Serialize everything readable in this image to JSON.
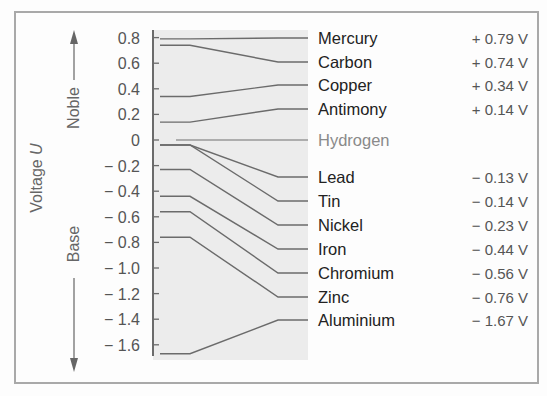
{
  "chart_data": {
    "type": "table",
    "title": "",
    "ylabel": "Voltage U",
    "ylim": [
      -1.7,
      0.85
    ],
    "yticks": [
      "0.8",
      "0.6",
      "0.4",
      "0.2",
      "0",
      "− 0.2",
      "− 0.4",
      "− 0.6",
      "− 0.8",
      "− 1.0",
      "− 1.2",
      "− 1.4",
      "− 1.6"
    ],
    "ytick_values": [
      0.8,
      0.6,
      0.4,
      0.2,
      0,
      -0.2,
      -0.4,
      -0.6,
      -0.8,
      -1.0,
      -1.2,
      -1.4,
      -1.6
    ],
    "annotations": {
      "up": "Noble",
      "down": "Base"
    },
    "series": [
      {
        "name": "Mercury",
        "value": 0.79,
        "label": "+ 0.79 V"
      },
      {
        "name": "Carbon",
        "value": 0.74,
        "label": "+ 0.74 V"
      },
      {
        "name": "Copper",
        "value": 0.34,
        "label": "+ 0.34 V"
      },
      {
        "name": "Antimony",
        "value": 0.14,
        "label": "+ 0.14 V"
      },
      {
        "name": "Hydrogen",
        "value": 0,
        "label": ""
      },
      {
        "name": "Lead",
        "value": -0.13,
        "label": "− 0.13 V"
      },
      {
        "name": "Tin",
        "value": -0.14,
        "label": "− 0.14 V"
      },
      {
        "name": "Nickel",
        "value": -0.23,
        "label": "− 0.23 V"
      },
      {
        "name": "Iron",
        "value": -0.44,
        "label": "− 0.44 V"
      },
      {
        "name": "Chromium",
        "value": -0.56,
        "label": "− 0.56 V"
      },
      {
        "name": "Zinc",
        "value": -0.76,
        "label": "− 0.76 V"
      },
      {
        "name": "Aluminium",
        "value": -1.67,
        "label": "− 1.67 V"
      }
    ]
  },
  "labels": {
    "axis": "Voltage U",
    "axis_main": "Voltage ",
    "axis_var": "U",
    "noble": "Noble",
    "base": "Base"
  },
  "colors": {
    "plot_bg": "#ececec",
    "line": "#6b6b6b",
    "text": "#222222",
    "muted": "#8a8a8a",
    "frame": "#a9a9a9"
  }
}
